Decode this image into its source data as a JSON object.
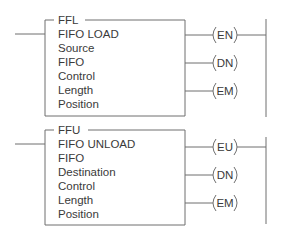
{
  "blocks": [
    {
      "mnemonic": "FFL",
      "title": "FIFO LOAD",
      "params": [
        "Source",
        "FIFO",
        "Control",
        "Length",
        "Position"
      ],
      "coils": [
        "EN",
        "DN",
        "EM"
      ]
    },
    {
      "mnemonic": "FFU",
      "title": "FIFO UNLOAD",
      "params": [
        "FIFO",
        "Destination",
        "Control",
        "Length",
        "Position"
      ],
      "coils": [
        "EU",
        "DN",
        "EM"
      ]
    }
  ]
}
